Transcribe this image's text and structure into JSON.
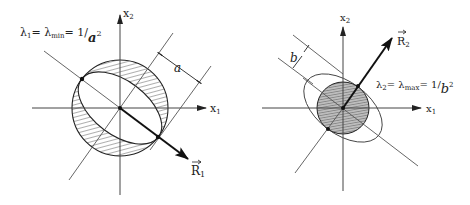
{
  "left": {
    "axis_x": "x₁",
    "axis_x_base": "x",
    "axis_x_sub": "1",
    "axis_y_base": "x",
    "axis_y_sub": "2",
    "vector_base": "R",
    "vector_sub": "1",
    "dimension": "a",
    "eq_lhs": "λ",
    "eq_lhs_sub": "1",
    "eq_mid": "= λ",
    "eq_mid_sub": "min",
    "eq_rhs": "= 1/",
    "eq_den": "a",
    "eq_exp": "2"
  },
  "right": {
    "axis_x_base": "x",
    "axis_x_sub": "1",
    "axis_y_base": "x",
    "axis_y_sub": "2",
    "vector_base": "R",
    "vector_sub": "2",
    "dimension": "b",
    "eq_lhs": "λ",
    "eq_lhs_sub": "2",
    "eq_mid": "= λ",
    "eq_mid_sub": "max",
    "eq_rhs": "= 1/",
    "eq_den": "b",
    "eq_exp": "2"
  }
}
